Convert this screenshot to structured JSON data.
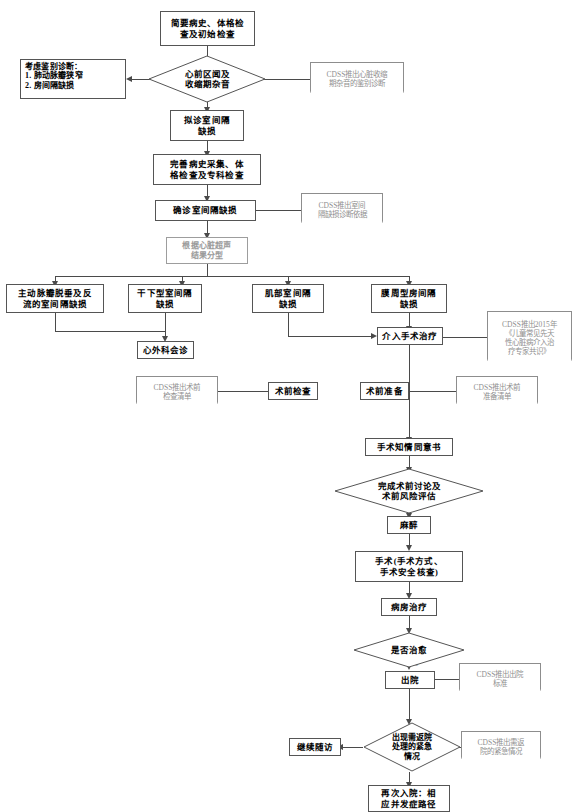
{
  "diagram": {
    "nodes": {
      "n01": "简要病史、体格检\n查及初始检查",
      "n01_l1": "简要病史、体格检",
      "n01_l2": "查及初始检查",
      "n02_l1": "心前区闻及",
      "n02_l2": "收缩期杂音",
      "n03_l1": "考虑鉴别诊断：",
      "n03_l2": "1. 肺动脉瓣狭窄",
      "n03_l3": "2. 房间隔缺损",
      "n04_l1": "CDSS推出心脏收缩",
      "n04_l2": "期杂音的鉴别诊断",
      "n05_l1": "拟诊室间隔",
      "n05_l2": "缺损",
      "n06_l1": "完善病史采集、体",
      "n06_l2": "格检查及专科检查",
      "n07": "确诊室间隔缺损",
      "n08_l1": "CDSS推出室间",
      "n08_l2": "隔缺损诊断依据",
      "n09_l1": "根据心脏超声",
      "n09_l2": "结果分型",
      "n10_l1": "主动脉瓣脱垂及反",
      "n10_l2": "流的室间隔缺损",
      "n11_l1": "干下型室间隔",
      "n11_l2": "缺损",
      "n12_l1": "肌部室间隔",
      "n12_l2": "缺损",
      "n13_l1": "膜周型房间隔",
      "n13_l2": "缺损",
      "n14": "心外科会诊",
      "n15": "介入手术治疗",
      "n16_l1": "CDSS推出2015年",
      "n16_l2": "《儿童常见先天",
      "n16_l3": "性心脏病介入治",
      "n16_l4": "疗专家共识》",
      "n17_l1": "CDSS推出术前",
      "n17_l2": "检查清单",
      "n18": "术前检查",
      "n19": "术前准备",
      "n20_l1": "CDSS推出术前",
      "n20_l2": "准备清单",
      "n21": "手术知情同意书",
      "n22_l1": "完成术前讨论及",
      "n22_l2": "术前风险评估",
      "n23": "麻醉",
      "n24_l1": "手术(手术方式、",
      "n24_l2": "手术安全核查)",
      "n25": "病房治疗",
      "n26": "是否治愈",
      "n27": "出院",
      "n28_l1": "CDSS推出出院",
      "n28_l2": "标准",
      "n29_l1": "出现需返院",
      "n29_l2": "处理的紧急",
      "n29_l3": "情况",
      "n30_l1": "CDSS推出需返",
      "n30_l2": "院的紧急情况",
      "n31": "继续随访",
      "n32_l1": "再次入院：相",
      "n32_l2": "应并发症路径"
    },
    "edge_labels": {
      "cured_yes": "是"
    },
    "colors": {
      "line": "#4a4a4a",
      "note_text": "#8f8f8f",
      "gray_node": "#9a9a9a",
      "node_border": "#555555",
      "background": "#ffffff"
    }
  }
}
